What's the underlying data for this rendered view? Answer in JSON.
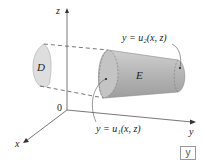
{
  "figure": {
    "axes": {
      "z_label": "z",
      "x_label": "x",
      "y_label": "y",
      "origin_label": "0"
    },
    "regions": {
      "projection_label": "D",
      "solid_label": "E"
    },
    "surfaces": {
      "upper": "y = u₂(x, z)",
      "lower": "y = u₁(x, z)"
    },
    "corner_badge": "y"
  },
  "colors": {
    "solid_fill": "#b8b8b8",
    "projection_fill": "#d9d9d9",
    "axis": "#555555",
    "dashed": "#555555"
  }
}
